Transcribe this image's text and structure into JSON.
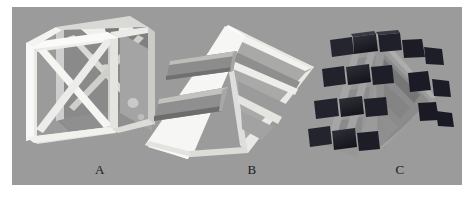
{
  "figure": {
    "background_color": "#ffffff",
    "plate_color": "#9b9b9b",
    "width": 472,
    "height": 200
  },
  "specimens": [
    {
      "id": "specimen-a",
      "label": "A",
      "shape": "cube",
      "description": "Open white cubic lattice frame with internal diagonal cross bracing",
      "frame_color": "#f4f4f2",
      "shade_color": "#8e8e8e",
      "interior_color": "#7d7d7d"
    },
    {
      "id": "specimen-b",
      "label": "B",
      "shape": "triangular-prism",
      "description": "White triangular prism shell with two horizontal rectangular slots on the front face",
      "frame_color": "#f6f6f4",
      "shade_color": "#d8d8d6",
      "interior_color": "#8a8a8a"
    },
    {
      "id": "specimen-c",
      "label": "C",
      "shape": "triangular-prism-lattice",
      "description": "Triangular prism lattice grid filled with dark block inserts",
      "frame_color": "#9d9d9d",
      "block_color": "#24242c",
      "shade_color": "#6f6f6f",
      "interior_color": "#868686"
    }
  ],
  "labels": {
    "a": "A",
    "b": "B",
    "c": "C"
  },
  "colors": {
    "plate": "#9b9b9b",
    "white_frame": "#f4f4f2",
    "dark_block": "#24242c",
    "label_text": "#1a1a1a"
  }
}
